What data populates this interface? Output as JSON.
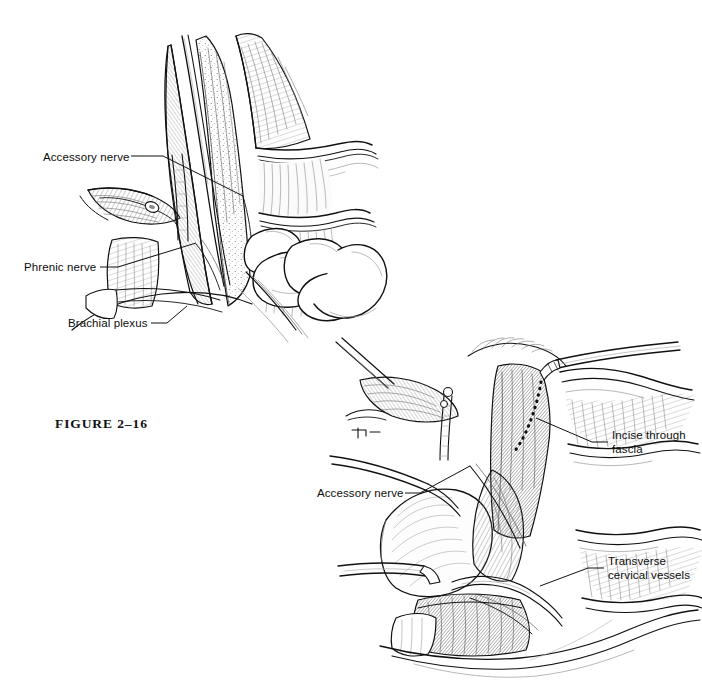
{
  "figure": {
    "number_label": "FIGURE 2–16",
    "domain": "medical-illustration",
    "background_color": "#ffffff",
    "ink_color": "#111111",
    "panel_count": 2,
    "panels": [
      {
        "id": "upper-panel",
        "description": "Posterior triangle of the neck dissection with surgeon's gloved hand retracting the sternocleidomastoid muscle",
        "labels": [
          "Accessory nerve",
          "Phrenic nerve",
          "Brachial plexus"
        ]
      },
      {
        "id": "lower-panel",
        "description": "Deeper exposure with retractors, dotted incision line through fascia, accessory nerve and transverse cervical vessels",
        "labels": [
          "Incise through fascia",
          "Accessory nerve",
          "Transverse cervical vessels"
        ]
      }
    ]
  },
  "annotations": {
    "upper": [
      {
        "id": "accessory-nerve-upper",
        "text": "Accessory nerve",
        "x": 43,
        "y": 151,
        "align": "left",
        "leader": [
          [
            131,
            156
          ],
          [
            163,
            156
          ],
          [
            243,
            196
          ]
        ]
      },
      {
        "id": "phrenic-nerve",
        "text": "Phrenic nerve",
        "x": 24,
        "y": 261,
        "align": "left",
        "leader": [
          [
            100,
            267
          ],
          [
            118,
            267
          ],
          [
            196,
            243
          ]
        ]
      },
      {
        "id": "brachial-plexus",
        "text": "Brachial plexus",
        "x": 68,
        "y": 317,
        "align": "left",
        "leader": [
          [
            151,
            323
          ],
          [
            167,
            323
          ],
          [
            187,
            306
          ]
        ]
      }
    ],
    "lower": [
      {
        "id": "incise-through-fascia",
        "text_line1": "Incise through",
        "text_line2": "fascia",
        "x": 612,
        "y": 436,
        "align": "left",
        "leader": [
          [
            608,
            442
          ],
          [
            592,
            442
          ],
          [
            536,
            418
          ]
        ]
      },
      {
        "id": "accessory-nerve-lower",
        "text": "Accessory nerve",
        "x": 317,
        "y": 487,
        "align": "left",
        "leader": [
          [
            405,
            493
          ],
          [
            420,
            493
          ],
          [
            470,
            466
          ]
        ]
      },
      {
        "id": "transverse-cervical-vessels",
        "text_line1": "Transverse",
        "text_line2": "cervical vessels",
        "x": 608,
        "y": 562,
        "align": "left",
        "leader": [
          [
            604,
            568
          ],
          [
            588,
            568
          ],
          [
            540,
            586
          ]
        ]
      }
    ]
  },
  "colors": {
    "ink": "#111111",
    "ink_light": "#5b5b5b",
    "ink_mid": "#8a8a8a",
    "hatch": "#6e6e6e",
    "paper": "#ffffff",
    "tissue_tone": "#f2f2f2"
  }
}
